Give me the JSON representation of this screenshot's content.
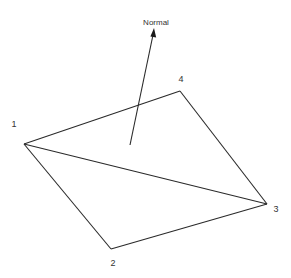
{
  "diagram": {
    "type": "quadrilateral-element-with-normal",
    "colors": {
      "stroke": "#2a2a2a",
      "text": "#333333",
      "background": "#ffffff"
    },
    "vertices": [
      {
        "id": "1",
        "label": "1",
        "x": 24,
        "y": 144,
        "label_x": 14,
        "label_y": 127
      },
      {
        "id": "2",
        "label": "2",
        "x": 111,
        "y": 249,
        "label_x": 110,
        "label_y": 266
      },
      {
        "id": "3",
        "label": "3",
        "x": 267,
        "y": 204,
        "label_x": 273,
        "label_y": 212
      },
      {
        "id": "4",
        "label": "4",
        "x": 180,
        "y": 91,
        "label_x": 178,
        "label_y": 82
      }
    ],
    "edges": [
      {
        "from": "1",
        "to": "4"
      },
      {
        "from": "4",
        "to": "3"
      },
      {
        "from": "3",
        "to": "2"
      },
      {
        "from": "2",
        "to": "1"
      },
      {
        "from": "1",
        "to": "3"
      }
    ],
    "normal": {
      "label": "Normal",
      "start_x": 130,
      "start_y": 145,
      "end_x": 154,
      "end_y": 28,
      "label_x": 156,
      "label_y": 25
    }
  }
}
